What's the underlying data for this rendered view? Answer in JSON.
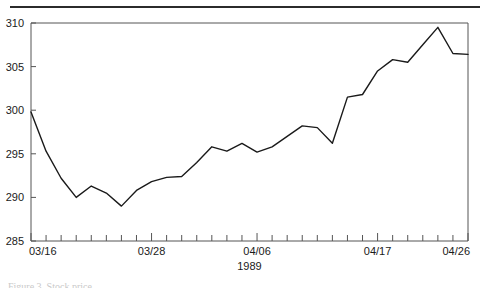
{
  "figure": {
    "has_top_rule": true,
    "background_color": "#ffffff",
    "line_color": "#1a1a1a",
    "axis_color": "#555555",
    "caption_partial": "Figure 3.   Stock price"
  },
  "chart_data": {
    "type": "line",
    "title": "",
    "xlabel": "1989",
    "ylabel": "",
    "grid": false,
    "legend": "none",
    "ylim": [
      285,
      310
    ],
    "ytick_labels": [
      "285",
      "290",
      "295",
      "300",
      "305",
      "310"
    ],
    "ytick_values": [
      285,
      290,
      295,
      300,
      305,
      310
    ],
    "xtick_labels": [
      "03/16",
      "03/28",
      "04/06",
      "04/17",
      "04/26"
    ],
    "xtick_label_indices": [
      0,
      8,
      15,
      23,
      29
    ],
    "n_minor_ticks": 30,
    "x": [
      "03/16",
      "03/17",
      "03/20",
      "03/21",
      "03/22",
      "03/23",
      "03/24",
      "03/27",
      "03/28",
      "03/29",
      "03/30",
      "03/31",
      "04/03",
      "04/04",
      "04/05",
      "04/06",
      "04/07",
      "04/10",
      "04/11",
      "04/12",
      "04/13",
      "04/14",
      "04/17",
      "04/18",
      "04/19",
      "04/20",
      "04/21",
      "04/24",
      "04/25",
      "04/26"
    ],
    "values": [
      299.8,
      295.3,
      292.2,
      290.0,
      291.3,
      290.5,
      289.0,
      290.8,
      291.8,
      292.3,
      292.4,
      294.0,
      295.8,
      295.3,
      296.2,
      295.2,
      295.8,
      297.0,
      298.2,
      298.0,
      296.2,
      301.5,
      301.8,
      304.5,
      305.8,
      305.5,
      307.5,
      309.5,
      306.5,
      306.4
    ]
  }
}
